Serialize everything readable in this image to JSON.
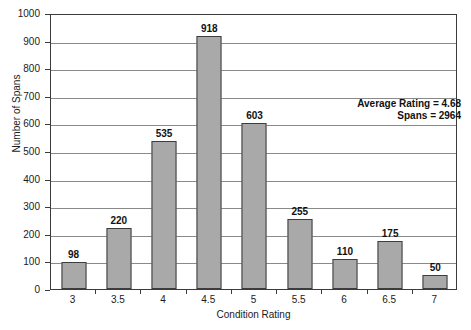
{
  "chart_data": {
    "type": "bar",
    "title": "",
    "xlabel": "Condition Rating",
    "ylabel": "Number of Spans",
    "categories": [
      "3",
      "3.5",
      "4",
      "4.5",
      "5",
      "5.5",
      "6",
      "6.5",
      "7"
    ],
    "values": [
      98,
      220,
      535,
      918,
      603,
      255,
      110,
      175,
      50
    ],
    "data_labels": [
      "98",
      "220",
      "535",
      "918",
      "603",
      "255",
      "110",
      "175",
      "50"
    ],
    "ylim": [
      0,
      1000
    ],
    "yticks": [
      0,
      100,
      200,
      300,
      400,
      500,
      600,
      700,
      800,
      900,
      1000
    ],
    "ytick_labels": [
      "0",
      "100",
      "200",
      "300",
      "400",
      "500",
      "600",
      "700",
      "800",
      "900",
      "1000"
    ],
    "grid": "horizontal",
    "legend": "none",
    "annotations": [
      "Average Rating = 4.68",
      "Spans = 2964"
    ],
    "colors": {
      "bar_fill": "#a9a9a9",
      "bar_border": "#3d3d3d",
      "gridline": "#8a8a8a",
      "axis": "#3b3b3b",
      "background": "#ffffff",
      "text": "#1a1a1a"
    }
  }
}
